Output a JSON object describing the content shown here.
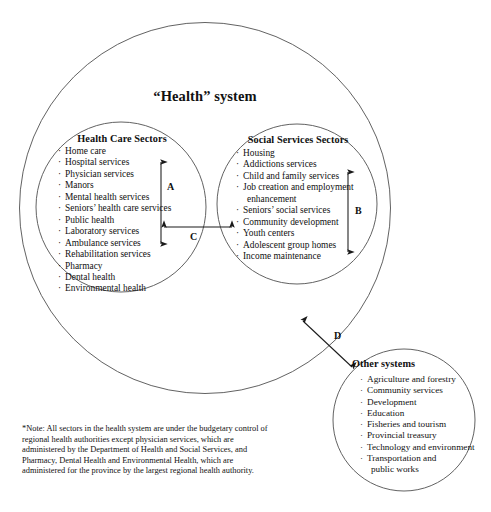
{
  "diagram": {
    "top_caption": "",
    "system_title": "“Health” system",
    "groups": {
      "health_care": {
        "heading": "Health Care Sectors",
        "items": [
          "Home care",
          "Hospital services",
          "Physician services",
          "Manors",
          "Mental health services",
          "Seniors’ health care services",
          "Public health",
          "Laboratory services",
          "Ambulance services",
          "Rehabilitation services",
          "Pharmacy",
          "Dental health",
          "Environmental health"
        ]
      },
      "social_services": {
        "heading": "Social Services Sectors",
        "items": [
          "Housing",
          "Addictions services",
          "Child and family services",
          "Job creation and employment",
          "enhancement",
          "Seniors’ social services",
          "Community development",
          "Youth centers",
          "Adolescent group homes",
          "Income maintenance"
        ],
        "continuation_indices": [
          4
        ]
      },
      "other_systems": {
        "heading": "Other systems",
        "items": [
          "Agriculture and forestry",
          "Community services",
          "Development",
          "Education",
          "Fisheries and tourism",
          "Provincial treasury",
          "Technology and environment",
          "Transportation and",
          "public works"
        ],
        "continuation_indices": [
          8
        ]
      }
    },
    "arrows": {
      "a": "A",
      "b": "B",
      "c": "C",
      "d": "D"
    },
    "footnote": "*Note: All sectors in the health system are under the budgetary control of regional health authorities except physician services, which are administered by the Department of Health and Social Services, and Pharmacy, Dental Health and Environmental Health, which are administered for the province by the largest regional health authority.",
    "colors": {
      "stroke": "#4a4a4a",
      "arrow": "#1a1a1a",
      "text": "#111111",
      "background": "#ffffff"
    }
  }
}
